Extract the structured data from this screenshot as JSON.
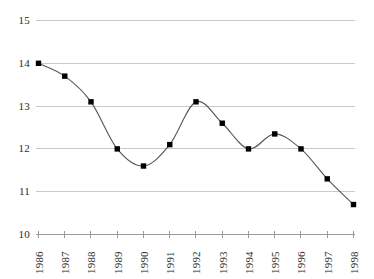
{
  "chart_data": {
    "type": "line",
    "title": "",
    "xlabel": "",
    "ylabel": "",
    "categories": [
      "1986",
      "1987",
      "1988",
      "1989",
      "1990",
      "1991",
      "1992",
      "1993",
      "1994",
      "1995",
      "1996",
      "1997",
      "1998"
    ],
    "values": [
      14.0,
      13.7,
      13.1,
      12.0,
      11.6,
      12.1,
      13.1,
      12.6,
      12.0,
      12.35,
      12.0,
      11.3,
      10.7
    ],
    "series": [
      {
        "name": "series-1",
        "values": [
          14.0,
          13.7,
          13.1,
          12.0,
          11.6,
          12.1,
          13.1,
          12.6,
          12.0,
          12.35,
          12.0,
          11.3,
          10.7
        ]
      }
    ],
    "ylim": [
      10,
      15
    ],
    "yticks": [
      10,
      11,
      12,
      13,
      14,
      15
    ],
    "ytick_labels": [
      "10",
      "11",
      "12",
      "13",
      "14",
      "15"
    ],
    "xlim": [
      "1986",
      "1998"
    ],
    "grid": "horizontal",
    "legend": "none",
    "marker": "square",
    "line_smoothing": "spline",
    "colors": {
      "line": "#555555",
      "marker": "#000000",
      "gridline": "#c9c9c9",
      "axis": "#9a9a9a",
      "text": "#2b2b2b",
      "background": "#ffffff"
    },
    "annotations": []
  },
  "axes": {
    "y_axis_name": "y-axis",
    "x_axis_name": "x-axis"
  }
}
